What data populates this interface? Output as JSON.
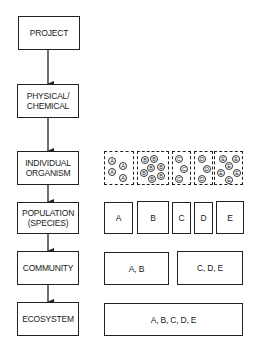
{
  "levels": [
    {
      "label": "PROJECT"
    },
    {
      "label": "PHYSICAL/\nCHEMICAL"
    },
    {
      "label": "INDIVIDUAL\nORGANISM"
    },
    {
      "label": "POPULATION\n(SPECIES)"
    },
    {
      "label": "COMMUNITY"
    },
    {
      "label": "ECOSYSTEM"
    }
  ],
  "organism_groups": [
    {
      "species": "A",
      "count": 6
    },
    {
      "species": "B",
      "count": 8
    },
    {
      "species": "C",
      "count": 3
    },
    {
      "species": "D",
      "count": 3
    },
    {
      "species": "E",
      "count": 6
    }
  ],
  "population": {
    "boxes": [
      "A",
      "B",
      "C",
      "D",
      "E"
    ]
  },
  "community": {
    "boxes": [
      "A, B",
      "C, D, E"
    ]
  },
  "ecosystem": {
    "boxes": [
      "A, B, C, D, E"
    ]
  }
}
